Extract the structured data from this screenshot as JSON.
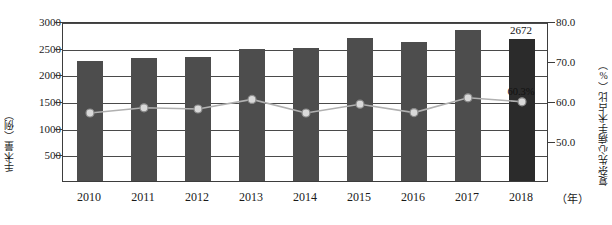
{
  "chart_data": {
    "type": "bar",
    "title": "",
    "subtitle": "",
    "xlabel": "（年）",
    "ylabel": "手术量（例）",
    "y2label": "复杂先心病手术占比（%）",
    "categories": [
      "2010",
      "2011",
      "2012",
      "2013",
      "2014",
      "2015",
      "2016",
      "2017",
      "2018"
    ],
    "ylim": [
      0,
      3000
    ],
    "y2lim": [
      40.0,
      80.0
    ],
    "yticks": [
      "500",
      "1000",
      "1500",
      "2000",
      "2500",
      "3000"
    ],
    "ytick_values": [
      500,
      1000,
      1500,
      2000,
      2500,
      3000
    ],
    "y2ticks": [
      "50.0",
      "60.0",
      "70.0",
      "80.0"
    ],
    "y2tick_values": [
      50.0,
      60.0,
      70.0,
      80.0
    ],
    "grid": true,
    "legend": "none",
    "series": [
      {
        "name": "手术量（例）",
        "type": "bar",
        "axis": "left",
        "color": "#4d4d4d",
        "highlight_color": "#2b2b2b",
        "values": [
          2250,
          2300,
          2320,
          2480,
          2495,
          2680,
          2600,
          2830,
          2672
        ],
        "data_labels": [
          "",
          "",
          "",
          "",
          "",
          "",
          "",
          "",
          "2672"
        ]
      },
      {
        "name": "复杂先心病手术占比（%）",
        "type": "line",
        "axis": "right",
        "color": "#b0b0b0",
        "marker_fill": "#d9d9d9",
        "marker_edge": "#8a8a8a",
        "values": [
          57.5,
          58.8,
          58.5,
          60.9,
          57.5,
          59.7,
          57.6,
          61.3,
          60.3
        ],
        "data_labels": [
          "",
          "",
          "",
          "",
          "",
          "",
          "",
          "",
          "60.3%"
        ]
      }
    ]
  },
  "colors": {
    "bar": "#4d4d4d",
    "bar_highlight": "#2b2b2b",
    "line": "#b0b0b0",
    "frame": "#3d3d3d",
    "grid": "#4a4a4a",
    "text": "#1a1a1a"
  }
}
